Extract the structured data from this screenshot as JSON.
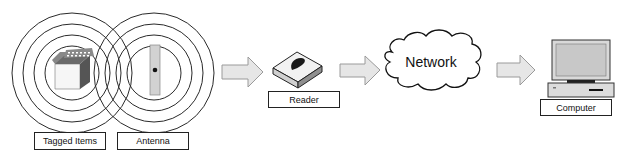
{
  "diagram": {
    "type": "rfid-system-flow",
    "nodes": [
      {
        "id": "tagged-items",
        "label": "Tagged Items",
        "icon": "tagged-box-icon"
      },
      {
        "id": "antenna",
        "label": "Antenna",
        "icon": "antenna-icon"
      },
      {
        "id": "reader",
        "label": "Reader",
        "icon": "reader-device-icon"
      },
      {
        "id": "network",
        "label": "Network",
        "icon": "cloud-icon"
      },
      {
        "id": "computer",
        "label": "Computer",
        "icon": "computer-icon"
      }
    ],
    "edges": [
      {
        "from": "antenna",
        "to": "reader",
        "icon": "arrow-right-icon"
      },
      {
        "from": "reader",
        "to": "network",
        "icon": "arrow-right-icon"
      },
      {
        "from": "network",
        "to": "computer",
        "icon": "arrow-right-icon"
      }
    ],
    "colors": {
      "line": "#222222",
      "arrow_fill": "#e4e4e4",
      "arrow_stroke": "#aaaaaa",
      "device_gray": "#bfbfbf",
      "dark_gray": "#555555"
    }
  }
}
